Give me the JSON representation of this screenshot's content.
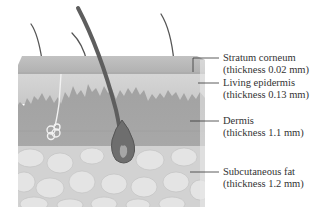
{
  "diagram": {
    "layers": [
      {
        "name": "Stratum corneum",
        "thickness": "(thickness 0.02 mm)"
      },
      {
        "name": "Living epidermis",
        "thickness": "(thickness 0.13 mm)"
      },
      {
        "name": "Dermis",
        "thickness": "(thickness 1.1 mm)"
      },
      {
        "name": "Subcutaneous fat",
        "thickness": "(thickness 1.2 mm)"
      }
    ],
    "colors": {
      "stratum_corneum": "#b8b8b8",
      "living_epidermis": "#cfcfcf",
      "dermis": "#9e9e9e",
      "fat": "#d9d9d9",
      "hair": "#555555",
      "leader_line": "#333333"
    }
  }
}
